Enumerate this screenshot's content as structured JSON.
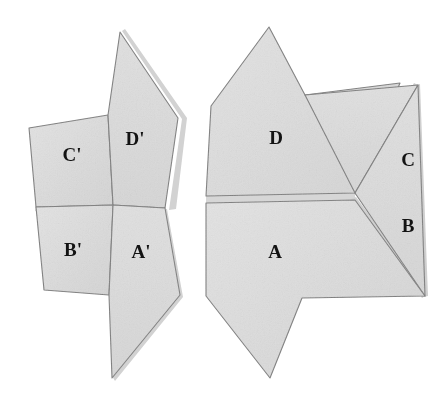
{
  "figure": {
    "background_color": "#ffffff",
    "piece_fill": "#dcdcdc",
    "piece_fill_light": "#e4e4e4",
    "piece_stroke": "#7a7a7a",
    "edge_shadow_color": "#a8a8a8",
    "label_color": "#131313",
    "canvas": {
      "width": 447,
      "height": 408
    }
  },
  "left_figure": {
    "name": "source-assembly",
    "pieces": [
      {
        "id": "c-prime",
        "label": "C'",
        "label_x": 72,
        "label_y": 157,
        "points": "29,128 108,115 113,205 36,207",
        "shadow": "none"
      },
      {
        "id": "d-prime",
        "label": "D'",
        "label_x": 135,
        "label_y": 141,
        "points": "120,32 178,118 165,208 113,205 108,115",
        "shadow": "right"
      },
      {
        "id": "b-prime",
        "label": "B'",
        "label_x": 73,
        "label_y": 252,
        "points": "36,207 113,205 109,295 44,290",
        "shadow": "none"
      },
      {
        "id": "a-prime",
        "label": "A'",
        "label_x": 141,
        "label_y": 254,
        "points": "113,205 165,208 180,295 112,378 109,295",
        "shadow": "right"
      }
    ]
  },
  "right_figure": {
    "name": "target-assembly",
    "pieces": [
      {
        "id": "d",
        "label": "D",
        "label_x": 276,
        "label_y": 140,
        "points": "269,27 305,95 400,83 355,193 206,196 211,106",
        "shadow": "none"
      },
      {
        "id": "c",
        "label": "C",
        "label_x": 408,
        "label_y": 162,
        "points": "305,95 418,85 355,193",
        "shadow": "right"
      },
      {
        "id": "b",
        "label": "B",
        "label_x": 408,
        "label_y": 228,
        "points": "355,193 418,85 425,296",
        "shadow": "right"
      },
      {
        "id": "a",
        "label": "A",
        "label_x": 275,
        "label_y": 254,
        "points": "206,203 355,200 425,296 302,298 270,378 206,296",
        "shadow": "none"
      }
    ]
  },
  "labels": {
    "left": [
      "C'",
      "D'",
      "B'",
      "A'"
    ],
    "right": [
      "D",
      "C",
      "B",
      "A"
    ]
  }
}
